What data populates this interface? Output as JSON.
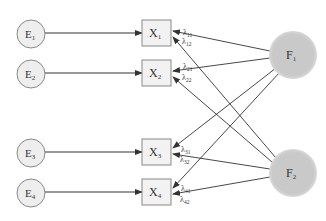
{
  "diagram": {
    "type": "factor-analysis-path-diagram",
    "colors": {
      "error_fill": "#eeeeee",
      "error_stroke": "#888888",
      "indicator_fill": "#f2f2f2",
      "indicator_stroke": "#888888",
      "factor_fill": "#c9c9c9",
      "arrow": "#333333"
    },
    "errors": [
      {
        "id": "E1",
        "base": "E",
        "sub": "1",
        "cx": 31,
        "cy": 34
      },
      {
        "id": "E2",
        "base": "E",
        "sub": "2",
        "cx": 31,
        "cy": 74
      },
      {
        "id": "E3",
        "base": "E",
        "sub": "3",
        "cx": 31,
        "cy": 153
      },
      {
        "id": "E4",
        "base": "E",
        "sub": "4",
        "cx": 31,
        "cy": 193
      }
    ],
    "indicators": [
      {
        "id": "X1",
        "base": "X",
        "sub": "1",
        "x": 142,
        "y": 20,
        "cy": 33
      },
      {
        "id": "X2",
        "base": "X",
        "sub": "2",
        "x": 142,
        "y": 60,
        "cy": 73
      },
      {
        "id": "X3",
        "base": "X",
        "sub": "3",
        "x": 142,
        "y": 139,
        "cy": 152
      },
      {
        "id": "X4",
        "base": "X",
        "sub": "4",
        "x": 142,
        "y": 179,
        "cy": 192
      }
    ],
    "factors": [
      {
        "id": "F1",
        "base": "F",
        "sub": "1",
        "cx": 293,
        "cy": 55
      },
      {
        "id": "F2",
        "base": "F",
        "sub": "2",
        "cx": 293,
        "cy": 173
      }
    ],
    "loadings": [
      {
        "label": "λ",
        "sub": "11",
        "from": "F1",
        "to": "X1"
      },
      {
        "label": "λ",
        "sub": "12",
        "from": "F2",
        "to": "X1"
      },
      {
        "label": "λ",
        "sub": "21",
        "from": "F1",
        "to": "X2"
      },
      {
        "label": "λ",
        "sub": "22",
        "from": "F2",
        "to": "X2"
      },
      {
        "label": "λ",
        "sub": "31",
        "from": "F1",
        "to": "X3"
      },
      {
        "label": "λ",
        "sub": "32",
        "from": "F2",
        "to": "X3"
      },
      {
        "label": "λ",
        "sub": "41",
        "from": "F1",
        "to": "X4"
      },
      {
        "label": "λ",
        "sub": "42",
        "from": "F2",
        "to": "X4"
      }
    ]
  }
}
